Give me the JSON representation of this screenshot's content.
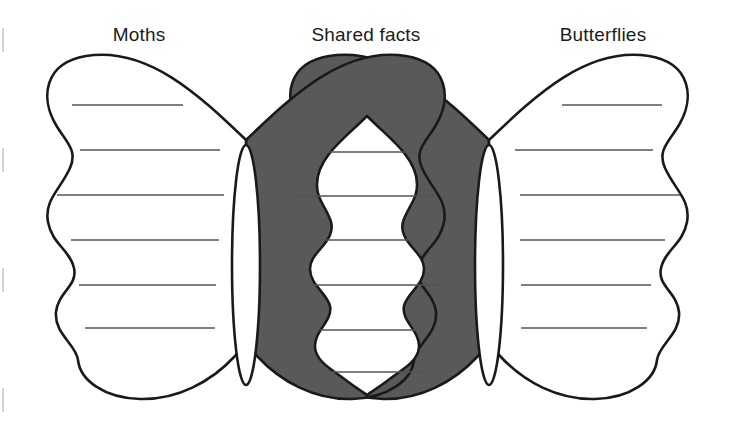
{
  "page": {
    "width": 732,
    "height": 443,
    "background_color": "#ffffff"
  },
  "colors": {
    "outline": "#1a1a1a",
    "overlap_fill": "#595959",
    "wing_fill": "#ffffff",
    "line_color": "#555555",
    "text_color": "#1c1c1c",
    "page_edge_mark": "#c9c9c9"
  },
  "labels": {
    "left": "Moths",
    "center": "Shared facts",
    "right": "Butterflies"
  },
  "label_positions": {
    "left_x": 139,
    "center_x": 366,
    "right_x": 603,
    "y": 41
  },
  "sections": {
    "left": {
      "name": "Moths",
      "role": "left-set-unique",
      "fill": "#ffffff",
      "line_count": 6,
      "lines": [
        {
          "x1": 72,
          "x2": 183,
          "y": 105
        },
        {
          "x1": 80,
          "x2": 220,
          "y": 150
        },
        {
          "x1": 57,
          "x2": 224,
          "y": 195
        },
        {
          "x1": 71,
          "x2": 219,
          "y": 240
        },
        {
          "x1": 79,
          "x2": 216,
          "y": 285
        },
        {
          "x1": 85,
          "x2": 215,
          "y": 328
        }
      ]
    },
    "center": {
      "name": "Shared facts",
      "role": "intersection",
      "fill": "#ffffff",
      "surround_fill": "#595959",
      "line_count": 6,
      "lines": [
        {
          "x1": 318,
          "x2": 417,
          "y": 152
        },
        {
          "x1": 291,
          "x2": 434,
          "y": 196
        },
        {
          "x1": 308,
          "x2": 428,
          "y": 240
        },
        {
          "x1": 312,
          "x2": 444,
          "y": 285
        },
        {
          "x1": 320,
          "x2": 417,
          "y": 330
        },
        {
          "x1": 327,
          "x2": 422,
          "y": 372
        }
      ]
    },
    "right": {
      "name": "Butterflies",
      "role": "right-set-unique",
      "fill": "#ffffff",
      "line_count": 6,
      "lines": [
        {
          "x1": 562,
          "x2": 662,
          "y": 105
        },
        {
          "x1": 515,
          "x2": 653,
          "y": 150
        },
        {
          "x1": 520,
          "x2": 680,
          "y": 195
        },
        {
          "x1": 520,
          "x2": 665,
          "y": 240
        },
        {
          "x1": 521,
          "x2": 651,
          "y": 285
        },
        {
          "x1": 521,
          "x2": 647,
          "y": 328
        }
      ]
    }
  },
  "bodies": [
    {
      "name": "left-body-lens",
      "cx": 246,
      "cy": 265,
      "rx": 14,
      "ry": 120
    },
    {
      "name": "right-body-lens",
      "cx": 489,
      "cy": 265,
      "rx": 14,
      "ry": 120
    }
  ],
  "edge_marks": [
    {
      "x": 3,
      "y1": 28,
      "y2": 52
    },
    {
      "x": 3,
      "y1": 148,
      "y2": 172
    },
    {
      "x": 3,
      "y1": 268,
      "y2": 292
    },
    {
      "x": 3,
      "y1": 388,
      "y2": 412
    }
  ],
  "geometry": {
    "left_wing_path": "M 246,140 C 200,96 148,46 86,56 C 44,63 40,98 56,125 C 66,142 78,150 70,168 C 60,190 44,200 48,222 C 52,244 70,250 74,268 C 78,286 58,292 56,312 C 54,334 76,344 78,360 C 80,380 104,398 140,399 C 178,400 212,382 236,356 C 244,347 246,340 246,330 Z",
    "left_wing_outer_path": "M 246,140 C 200,96 148,46 86,56 C 44,63 40,98 56,125 C 66,142 78,150 70,168 C 60,190 44,200 48,222 C 52,244 70,250 74,268 C 78,286 58,292 56,312 C 54,334 76,344 78,360 C 80,380 104,398 140,399 C 178,400 212,382 236,356 C 244,347 246,340 246,330 Z",
    "right_wing_path": "M 489,140 C 535,96 587,46 649,56 C 691,63 695,98 679,125 C 669,142 657,150 665,168 C 675,190 691,200 687,222 C 683,244 665,250 661,268 C 657,286 677,292 679,312 C 681,334 659,344 657,360 C 655,380 631,398 595,399 C 557,400 523,382 499,356 C 491,347 489,340 489,330 Z",
    "center_overlap_left_path": "M 489,140 C 443,96 391,46 329,56 C 287,63 283,98 299,125 C 309,142 321,150 313,168 C 303,190 287,200 291,222 C 295,244 313,250 317,268 C 321,286 301,292 299,312 C 297,334 319,344 321,360 C 323,380 347,398 383,399",
    "center_overlap_right_path": "M 246,140 C 292,96 344,46 406,56 C 448,63 452,98 436,125 C 426,142 414,150 422,168 C 432,190 448,200 444,222 C 440,244 422,250 418,268 C 414,286 434,292 436,312 C 438,334 416,344 414,360 C 412,380 388,398 352,399",
    "center_white_path": "M 367,118 C 352,132 340,142 330,155 C 318,171 316,186 322,200 C 328,214 334,222 330,234 C 325,248 312,254 312,268 C 312,284 328,292 331,305 C 334,320 316,330 317,346 C 318,362 336,370 348,380 C 356,387 362,390 367,394 C 372,390 378,387 386,380 C 398,370 416,362 417,346 C 418,330 400,320 403,305 C 406,292 422,284 422,268 C 422,254 409,248 404,234 C 400,222 406,214 412,200 C 418,186 416,171 404,155 C 394,142 382,132 367,118 Z"
  }
}
